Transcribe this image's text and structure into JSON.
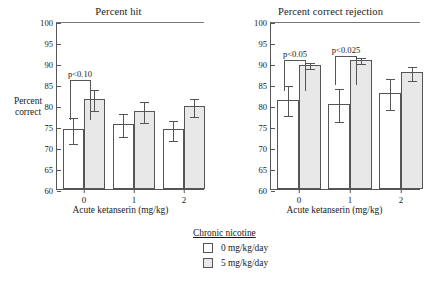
{
  "chart_data": {
    "type": "bar",
    "title": "",
    "panels": [
      {
        "title": "Percent hit",
        "xlabel": "Acute ketanserin (mg/kg)",
        "ylabel": "Percent correct",
        "ylim": [
          60,
          100
        ],
        "yticks": [
          100,
          95,
          90,
          85,
          80,
          75,
          70,
          65,
          60
        ],
        "categories": [
          "0",
          "1",
          "2"
        ],
        "grid": false,
        "series": [
          {
            "name": "0 mg/kg/day",
            "values": [
              74.2,
              75.5,
              74.2
            ],
            "errors": [
              3.2,
              2.8,
              2.5
            ]
          },
          {
            "name": "5 mg/kg/day",
            "values": [
              81.4,
              78.6,
              79.7
            ],
            "errors": [
              2.7,
              2.7,
              2.3
            ]
          }
        ],
        "annotations": [
          {
            "text": "p<0.10",
            "group": "0"
          }
        ]
      },
      {
        "title": "Percent correct rejection",
        "xlabel": "Acute ketanserin (mg/kg)",
        "ylabel": "Percent correct",
        "ylim": [
          60,
          100
        ],
        "yticks": [
          100,
          95,
          90,
          85,
          80,
          75,
          70,
          65,
          60
        ],
        "categories": [
          "0",
          "1",
          "2"
        ],
        "grid": false,
        "series": [
          {
            "name": "0 mg/kg/day",
            "values": [
              81.3,
              80.2,
              82.8
            ],
            "errors": [
              3.6,
              4.1,
              3.8
            ]
          },
          {
            "name": "5 mg/kg/day",
            "values": [
              89.6,
              90.8,
              87.8
            ],
            "errors": [
              0.9,
              0.9,
              1.8
            ]
          }
        ],
        "annotations": [
          {
            "text": "p<0.05",
            "group": "0"
          },
          {
            "text": "p<0.025",
            "group": "1"
          }
        ]
      }
    ],
    "legend": {
      "title": "Chronic nicotine",
      "position": "bottom-center",
      "entries": [
        {
          "label": "0 mg/kg/day",
          "swatch": "open"
        },
        {
          "label": "5 mg/kg/day",
          "swatch": "filled"
        }
      ]
    },
    "colors": {
      "open_bar": "#ffffff",
      "filled_bar": "#e8e8e8",
      "line": "#555555",
      "text": "#1a1a1a",
      "background": "#ffffff"
    }
  },
  "panel_left": {
    "title": "Percent hit",
    "ylabel_line1": "Percent",
    "ylabel_line2": "correct",
    "xlabel": "Acute ketanserin (mg/kg)",
    "yticks": [
      "100",
      "95",
      "90",
      "85",
      "80",
      "75",
      "70",
      "65",
      "60"
    ],
    "xticks": [
      "0",
      "1",
      "2"
    ],
    "annotation_0": "p<0.10"
  },
  "panel_right": {
    "title": "Percent correct rejection",
    "xlabel": "Acute ketanserin (mg/kg)",
    "yticks": [
      "100",
      "95",
      "90",
      "85",
      "80",
      "75",
      "70",
      "65",
      "60"
    ],
    "xticks": [
      "0",
      "1",
      "2"
    ],
    "annotation_0": "p<0.05",
    "annotation_1": "p<0.025"
  },
  "legend": {
    "title": "Chronic nicotine",
    "entry_0": "0 mg/kg/day",
    "entry_1": "5 mg/kg/day"
  }
}
